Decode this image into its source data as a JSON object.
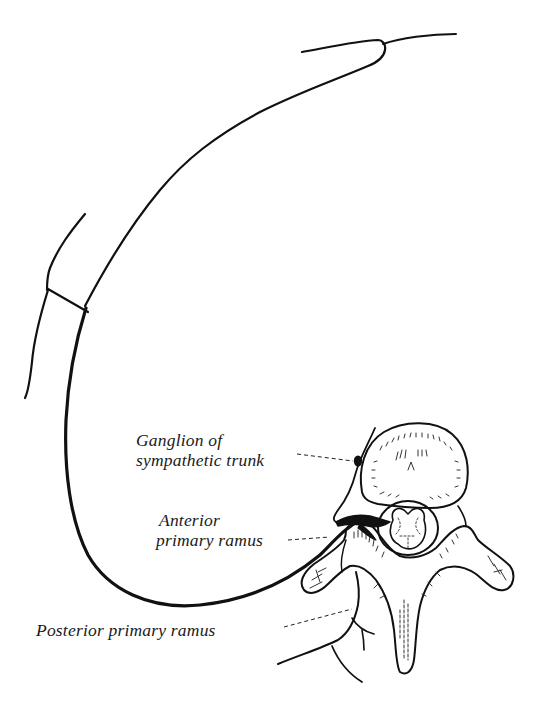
{
  "figure": {
    "type": "anatomical-line-illustration",
    "stroke_color": "#111111",
    "background_color": "#ffffff"
  },
  "labels": {
    "ganglion": {
      "line1": "Ganglion of",
      "line2": "sympathetic trunk"
    },
    "anterior": {
      "line1": "Anterior",
      "line2": "primary ramus"
    },
    "posterior": {
      "line1": "Posterior primary ramus"
    }
  }
}
